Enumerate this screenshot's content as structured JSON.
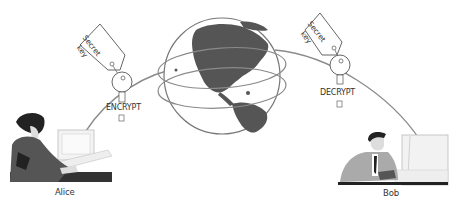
{
  "diagram": {
    "sender": {
      "name": "Alice",
      "action": "ENCRYPT",
      "key_tag": [
        "Secret",
        "key"
      ]
    },
    "receiver": {
      "name": "Bob",
      "action": "DECRYPT",
      "key_tag": [
        "Secret",
        "key"
      ]
    },
    "network": {
      "icon": "globe-icon",
      "rings": 2
    },
    "colors": {
      "line": "#8a8a8a",
      "globe_land": "#555555",
      "globe_outline": "#777777",
      "text": "#333333"
    }
  }
}
